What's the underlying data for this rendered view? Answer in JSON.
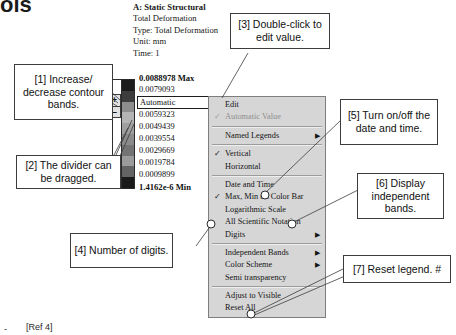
{
  "page": {
    "partial_heading": "ols",
    "ref_note": "[Ref 4]",
    "ref_bullet": "-"
  },
  "result_header": {
    "line1": "A: Static Structural",
    "line2": "Total Deformation",
    "line3": "Type: Total Deformation",
    "line4": "Unit: mm",
    "line5": "Time: 1"
  },
  "legend": {
    "values": [
      "0.0088978 Max",
      "0.0079093",
      "Automatic",
      "0.0059323",
      "0.0049439",
      "0.0039554",
      "0.0029669",
      "0.0019784",
      "0.0009899",
      "1.4162e-6 Min"
    ],
    "editing_index": 2,
    "colorbar_colors": [
      "#1c1c1c",
      "#3d3d3d",
      "#8d8d8d",
      "#b4b4b4",
      "#9f9f9f",
      "#8a8a8a",
      "#737373",
      "#9b9b9b",
      "#646464",
      "#1a1a1a"
    ],
    "stepper_increase": "+",
    "stepper_decrease": "–"
  },
  "context_menu": {
    "items": [
      {
        "label": "Edit",
        "check": "",
        "arrow": "",
        "disabled": false
      },
      {
        "label": "Automatic Value",
        "check": "✓",
        "arrow": "",
        "disabled": true
      },
      {
        "separator": true
      },
      {
        "label": "Named Legends",
        "check": "",
        "arrow": "▶",
        "disabled": false
      },
      {
        "separator": true
      },
      {
        "label": "Vertical",
        "check": "✓",
        "arrow": "",
        "disabled": false
      },
      {
        "label": "Horizontal",
        "check": "",
        "arrow": "",
        "disabled": false
      },
      {
        "separator": true
      },
      {
        "label": "Date and Time",
        "check": "",
        "arrow": "",
        "disabled": false
      },
      {
        "label": "Max, Min on Color Bar",
        "check": "✓",
        "arrow": "",
        "disabled": false
      },
      {
        "label": "Logarithmic Scale",
        "check": "",
        "arrow": "",
        "disabled": false
      },
      {
        "label": "All Scientific Notation",
        "check": "",
        "arrow": "",
        "disabled": false
      },
      {
        "label": "Digits",
        "check": "",
        "arrow": "▶",
        "disabled": false
      },
      {
        "separator": true
      },
      {
        "label": "Independent Bands",
        "check": "",
        "arrow": "▶",
        "disabled": false
      },
      {
        "label": "Color Scheme",
        "check": "",
        "arrow": "▶",
        "disabled": false
      },
      {
        "label": "Semi transparency",
        "check": "",
        "arrow": "",
        "disabled": false
      },
      {
        "separator": true
      },
      {
        "label": "Adjust to Visible",
        "check": "",
        "arrow": "",
        "disabled": false
      },
      {
        "label": "Reset All",
        "check": "",
        "arrow": "",
        "disabled": false
      }
    ]
  },
  "callouts": {
    "c1": "[1] Increase/ decrease contour bands.",
    "c2": "[2] The divider can be dragged.",
    "c3": "[3] Double-click to edit value.",
    "c4": "[4] Number of digits.",
    "c5": "[5] Turn on/off the date and time.",
    "c6": "[6] Display independent bands.",
    "c7": "[7] Reset legend. #"
  }
}
